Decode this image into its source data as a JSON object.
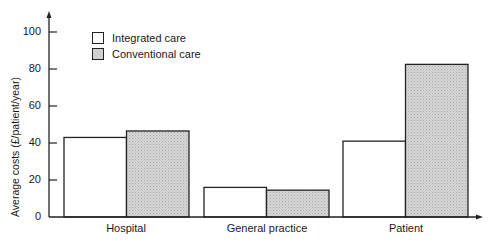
{
  "chart_data": {
    "type": "bar",
    "title": "",
    "xlabel": "",
    "ylabel": "Average costs (£/patient/year)",
    "ylim": [
      0,
      110
    ],
    "yticks": [
      0,
      20,
      40,
      60,
      80,
      100
    ],
    "grid": false,
    "legend_position": "upper-left-inside",
    "categories": [
      "Hospital",
      "General practice",
      "Patient"
    ],
    "series": [
      {
        "name": "Integrated care",
        "color": "#ffffff",
        "values": [
          43,
          16,
          41
        ]
      },
      {
        "name": "Conventional care",
        "color": "#d0d0d0",
        "values": [
          46.5,
          14.5,
          82.5
        ]
      }
    ]
  },
  "axis": {
    "ylabel": "Average costs (£/patient/year)",
    "ytick_labels": [
      "0",
      "20",
      "40",
      "60",
      "80",
      "100"
    ]
  },
  "legend": {
    "items": [
      {
        "label": "Integrated care",
        "color": "#ffffff"
      },
      {
        "label": "Conventional care",
        "color": "#d0d0d0"
      }
    ]
  },
  "categories": [
    "Hospital",
    "General practice",
    "Patient"
  ]
}
